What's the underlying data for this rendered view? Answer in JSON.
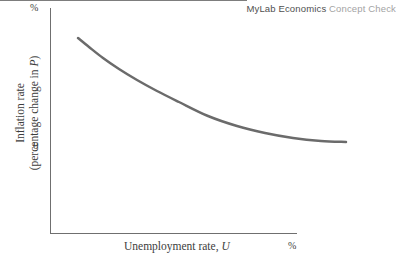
{
  "header": {
    "brand_main": "MyLab Economics",
    "brand_sub": "Concept Check",
    "brand_main_color": "#4f4f4f",
    "brand_sub_color": "#a3a3a3"
  },
  "axes": {
    "y_top_unit": "%",
    "y_zero_tick": "0",
    "x_right_unit": "%",
    "x_label_text": "Unemployment rate,",
    "x_label_variable": "U",
    "y_label_line1": "Inflation rate",
    "y_label_line2_prefix": "(percentage change in",
    "y_label_line2_variable": "P",
    "y_label_line2_suffix": ")"
  },
  "chart_data": {
    "type": "line",
    "title": "",
    "subtitle": "",
    "xlabel": "Unemployment rate, U",
    "ylabel": "Inflation rate (percentage change in P)",
    "xlim": [
      0,
      100
    ],
    "ylim": [
      -30,
      100
    ],
    "grid": false,
    "legend": "none",
    "annotations": [
      "%",
      "0",
      "%"
    ],
    "series": [
      {
        "name": "Phillips curve",
        "color": "#6b6b6b",
        "line_width": 2.5,
        "x": [
          11.3,
          14.0,
          17.5,
          21.5,
          26.0,
          31.0,
          36.5,
          43.7,
          51.0,
          58.0,
          65.0,
          72.0,
          78.1
        ],
        "y": [
          90.1,
          81.2,
          70.5,
          59.5,
          48.5,
          37.5,
          26.5,
          14.1,
          4.2,
          -3.2,
          -8.2,
          -11.0,
          -12.1
        ],
        "pixel_points": [
          [
            78,
            38
          ],
          [
            89,
            47
          ],
          [
            103,
            58
          ],
          [
            119,
            69
          ],
          [
            137,
            80
          ],
          [
            157,
            91
          ],
          [
            179,
            102
          ],
          [
            208,
            116
          ],
          [
            237,
            126
          ],
          [
            265,
            133
          ],
          [
            293,
            138
          ],
          [
            321,
            141
          ],
          [
            346,
            142
          ]
        ],
        "zero_crossing_x": 51.5,
        "notes": "Downward-sloping convex Phillips curve; crosses zero inflation line and flattens at negative inflation."
      }
    ],
    "reference_lines": [
      {
        "name": "zero-inflation-line",
        "orientation": "horizontal",
        "value": 0,
        "color": "#7d7d7d"
      }
    ]
  }
}
